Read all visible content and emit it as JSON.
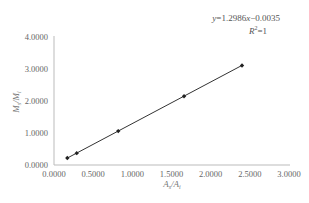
{
  "chart_data": {
    "type": "scatter",
    "title": "",
    "xlabel": "As/Ai",
    "ylabel": "Ms/Mi",
    "xlim": [
      0,
      3
    ],
    "ylim": [
      0,
      4
    ],
    "x_ticks": [
      "0.0000",
      "0.5000",
      "1.0000",
      "1.5000",
      "2.0000",
      "2.5000",
      "3.0000"
    ],
    "y_ticks": [
      "0.0000",
      "1.0000",
      "2.0000",
      "3.0000",
      "4.0000"
    ],
    "grid": false,
    "legend": null,
    "series": [
      {
        "name": "calibration",
        "marker": "diamond",
        "x": [
          0.17,
          0.29,
          0.82,
          1.66,
          2.4
        ],
        "y": [
          0.22,
          0.37,
          1.06,
          2.15,
          3.11
        ]
      }
    ],
    "trendline": {
      "type": "linear",
      "slope": 1.2986,
      "intercept": -0.0035,
      "equation": "y=1.2986x−0.0035",
      "r_squared": "R²=1"
    },
    "annotations": [
      "y=1.2986x−0.0035",
      "R²=1"
    ]
  },
  "labels": {
    "equation_prefix": "y",
    "equation_body": "=1.2986",
    "equation_x": "x",
    "equation_tail": "−0.0035",
    "r2_R": "R",
    "r2_sup": "2",
    "r2_tail": "=1",
    "xlabel_A1": "A",
    "xlabel_s": "s",
    "xlabel_slash": "/",
    "xlabel_A2": "A",
    "xlabel_i": "i",
    "ylabel_M1": "M",
    "ylabel_s": "s",
    "ylabel_slash": "/",
    "ylabel_M2": "M",
    "ylabel_i": "i"
  }
}
